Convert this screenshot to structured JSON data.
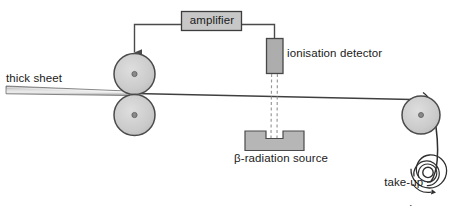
{
  "diagram": {
    "type": "schematic",
    "colors": {
      "stroke": "#4a4a4a",
      "stroke_dark": "#333333",
      "fill_grey": "#b3b3b3",
      "fill_roller": "#c9c9c9",
      "fill_box": "#c4c4c4",
      "background": "#ffffff",
      "text": "#1a1a1a"
    },
    "labels": {
      "amplifier": "amplifier",
      "ionisation_detector": "ionisation detector",
      "beta_radiation_source": "β-radiation source",
      "thick_sheet": "thick sheet",
      "take_up_spool_line1": "take-up",
      "take_up_spool_line2": "spool"
    },
    "components": [
      {
        "name": "amplifier-box",
        "kind": "box",
        "label": "amplifier"
      },
      {
        "name": "ionisation-detector",
        "kind": "vertical-box",
        "label": "ionisation detector"
      },
      {
        "name": "beta-radiation-source",
        "kind": "notched-block",
        "label": "β-radiation source"
      },
      {
        "name": "upper-roller",
        "kind": "circle",
        "label": ""
      },
      {
        "name": "lower-roller",
        "kind": "circle",
        "label": ""
      },
      {
        "name": "guide-roller",
        "kind": "circle",
        "label": ""
      },
      {
        "name": "take-up-spool",
        "kind": "spiral",
        "label": "take-up spool"
      },
      {
        "name": "thick-sheet",
        "kind": "tapered-strip",
        "label": "thick sheet"
      },
      {
        "name": "radiation-beam",
        "kind": "dashed-beam",
        "label": ""
      },
      {
        "name": "signal-wire",
        "kind": "polyline-with-arrow",
        "label": ""
      }
    ]
  }
}
